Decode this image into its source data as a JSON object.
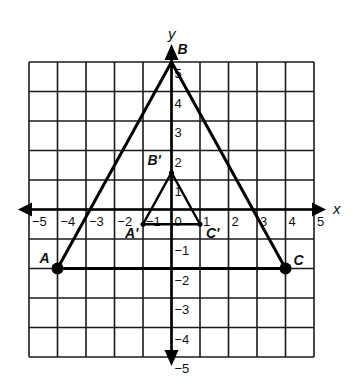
{
  "diagram": {
    "type": "coordinate-plane",
    "x_axis": {
      "label": "x",
      "min": -5,
      "max": 5,
      "tick_labels": [
        "-5",
        "-4",
        "-3",
        "-2",
        "-1",
        "0",
        "1",
        "2",
        "3",
        "4",
        "5"
      ]
    },
    "y_axis": {
      "label": "y",
      "min": -5,
      "max": 5,
      "tick_labels": [
        "-5",
        "-4",
        "-3",
        "-2",
        "-1",
        "1",
        "2",
        "3",
        "4",
        "5"
      ]
    },
    "grid": {
      "columns": 10,
      "rows": 10,
      "visible": true
    },
    "triangles": [
      {
        "name": "ABC",
        "vertices": [
          {
            "label": "A",
            "x": -4,
            "y": -2,
            "marked": true
          },
          {
            "label": "B",
            "x": 0,
            "y": 5,
            "marked": false
          },
          {
            "label": "C",
            "x": 4,
            "y": -2,
            "marked": true
          }
        ]
      },
      {
        "name": "A'B'C'",
        "vertices": [
          {
            "label": "A'",
            "x": -1,
            "y": -0.5,
            "marked": false
          },
          {
            "label": "B'",
            "x": 0,
            "y": 1.25,
            "marked": false
          },
          {
            "label": "C'",
            "x": 1,
            "y": -0.5,
            "marked": false
          }
        ]
      }
    ],
    "colors": {
      "line": "#000000",
      "background": "#ffffff"
    }
  }
}
